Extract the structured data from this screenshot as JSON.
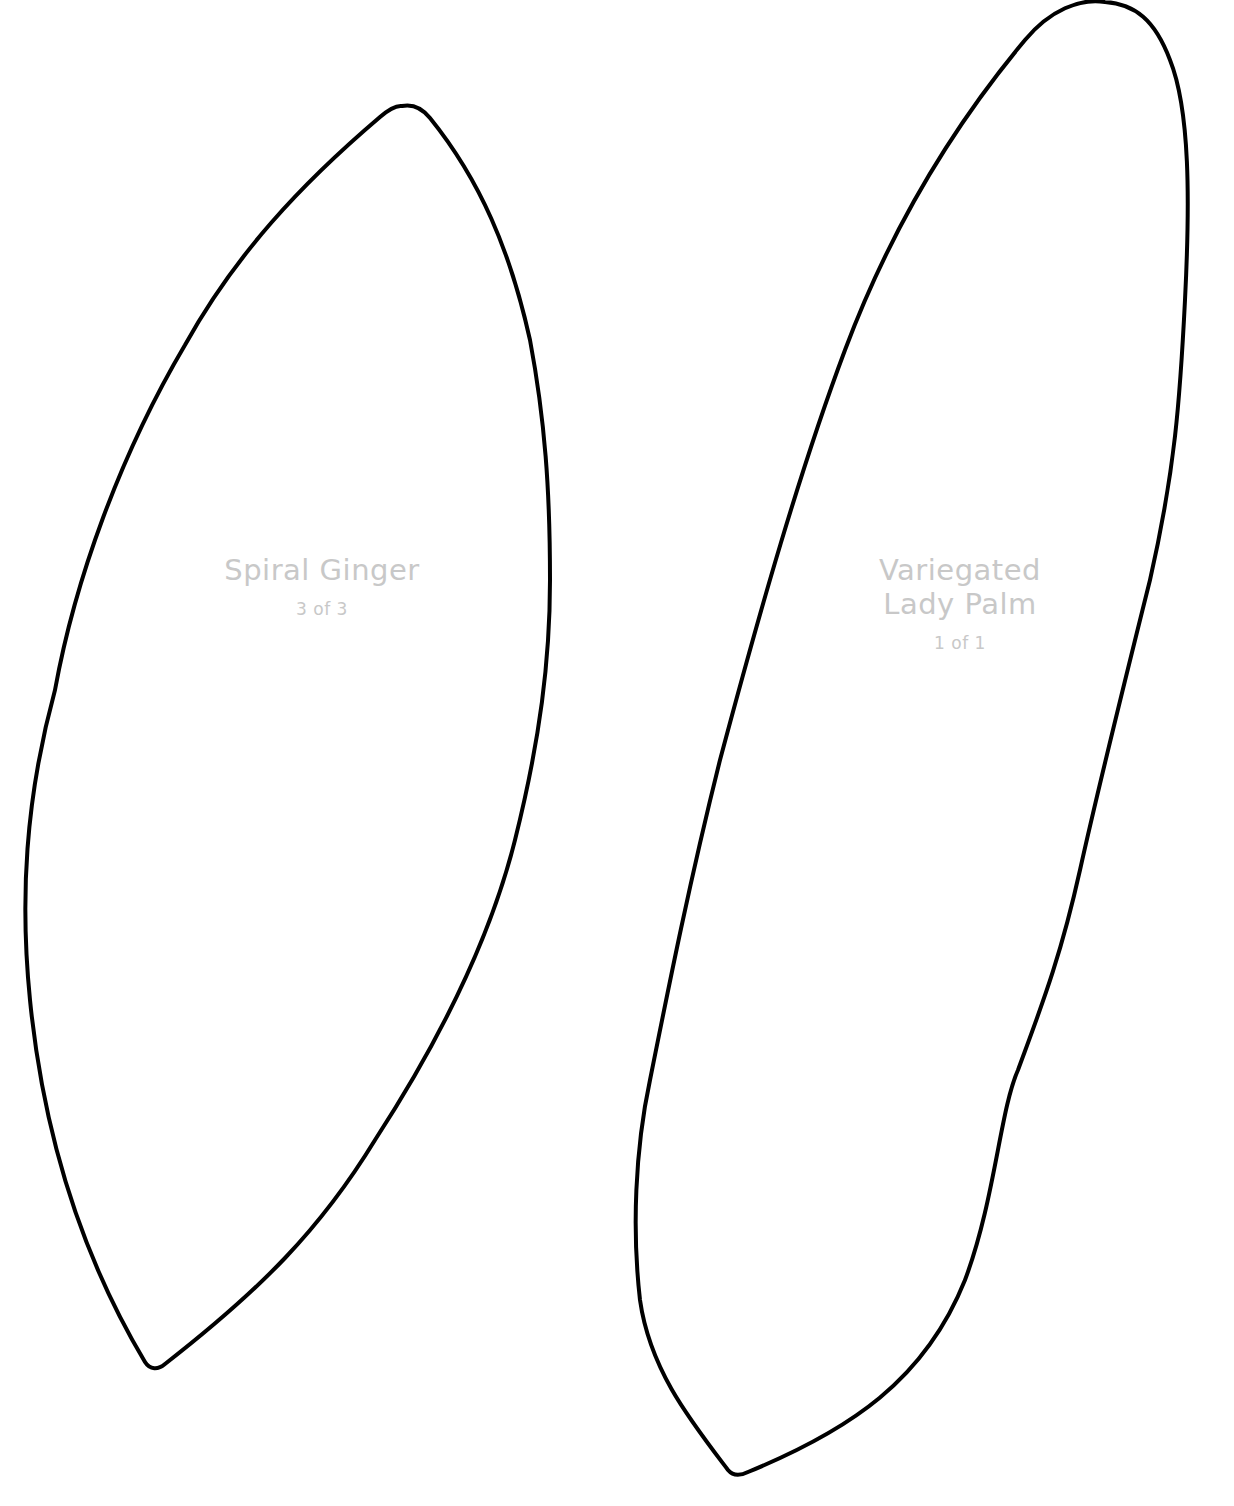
{
  "page": {
    "background": "#ffffff",
    "outline_color": "#000000",
    "label_color": "#c8c8c8"
  },
  "templates": [
    {
      "name": "Spiral Ginger",
      "count": "3 of 3",
      "shape": "leaf-outline"
    },
    {
      "name_line1": "Variegated",
      "name_line2": "Lady Palm",
      "count": "1 of 1",
      "shape": "leaf-outline"
    }
  ]
}
